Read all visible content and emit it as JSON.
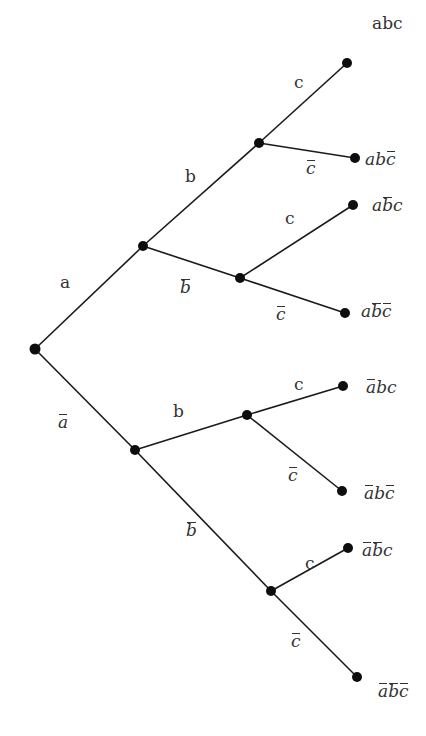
{
  "diagram": {
    "type": "probability-tree",
    "colors": {
      "background": "#ffffff",
      "line": "#1a1a1a",
      "node": "#0d0d0d",
      "text": "#333333"
    },
    "nodes": [
      {
        "id": "root",
        "x": 35,
        "y": 349
      },
      {
        "id": "a",
        "x": 143,
        "y": 246
      },
      {
        "id": "not_a",
        "x": 135,
        "y": 450
      },
      {
        "id": "ab",
        "x": 259,
        "y": 143
      },
      {
        "id": "a_not_b",
        "x": 240,
        "y": 278
      },
      {
        "id": "not_a_b",
        "x": 247,
        "y": 415
      },
      {
        "id": "not_a_not_b",
        "x": 271,
        "y": 591
      },
      {
        "id": "abc",
        "x": 347,
        "y": 63
      },
      {
        "id": "ab_not_c",
        "x": 355,
        "y": 158
      },
      {
        "id": "a_not_b_c",
        "x": 353,
        "y": 205
      },
      {
        "id": "a_not_b_not_c",
        "x": 345,
        "y": 313
      },
      {
        "id": "not_a_bc",
        "x": 343,
        "y": 386
      },
      {
        "id": "not_a_b_not_c",
        "x": 342,
        "y": 491
      },
      {
        "id": "not_a_not_b_c",
        "x": 348,
        "y": 548
      },
      {
        "id": "not_a_not_b_not_c",
        "x": 357,
        "y": 677
      }
    ],
    "edges": [
      {
        "from": "root",
        "to": "a",
        "label": "a",
        "barred": false,
        "lx": 60,
        "ly": 274
      },
      {
        "from": "root",
        "to": "not_a",
        "label": "a",
        "barred": true,
        "lx": 58,
        "ly": 414
      },
      {
        "from": "a",
        "to": "ab",
        "label": "b",
        "barred": false,
        "lx": 185,
        "ly": 168
      },
      {
        "from": "a",
        "to": "a_not_b",
        "label": "b",
        "barred": true,
        "lx": 180,
        "ly": 279
      },
      {
        "from": "not_a",
        "to": "not_a_b",
        "label": "b",
        "barred": false,
        "lx": 173,
        "ly": 403
      },
      {
        "from": "not_a",
        "to": "not_a_not_b",
        "label": "b",
        "barred": true,
        "lx": 186,
        "ly": 522
      },
      {
        "from": "ab",
        "to": "abc",
        "label": "c",
        "barred": false,
        "lx": 294,
        "ly": 74
      },
      {
        "from": "ab",
        "to": "ab_not_c",
        "label": "c",
        "barred": true,
        "lx": 306,
        "ly": 160
      },
      {
        "from": "a_not_b",
        "to": "a_not_b_c",
        "label": "c",
        "barred": false,
        "lx": 285,
        "ly": 210
      },
      {
        "from": "a_not_b",
        "to": "a_not_b_not_c",
        "label": "c",
        "barred": true,
        "lx": 276,
        "ly": 306
      },
      {
        "from": "not_a_b",
        "to": "not_a_bc",
        "label": "c",
        "barred": false,
        "lx": 294,
        "ly": 376
      },
      {
        "from": "not_a_b",
        "to": "not_a_b_not_c",
        "label": "c",
        "barred": true,
        "lx": 288,
        "ly": 467
      },
      {
        "from": "not_a_not_b",
        "to": "not_a_not_b_c",
        "label": "c",
        "barred": false,
        "lx": 305,
        "ly": 555
      },
      {
        "from": "not_a_not_b",
        "to": "not_a_not_b_not_c",
        "label": "c",
        "barred": true,
        "lx": 291,
        "ly": 633
      }
    ],
    "leaf_labels": [
      {
        "node": "abc",
        "text": "abc",
        "italic": false,
        "bars": [
          false,
          false,
          false
        ],
        "lx": 372,
        "ly": 15
      },
      {
        "node": "ab_not_c",
        "text": "abc",
        "italic": true,
        "bars": [
          false,
          false,
          true
        ],
        "lx": 365,
        "ly": 151
      },
      {
        "node": "a_not_b_c",
        "text": "abc",
        "italic": true,
        "bars": [
          false,
          true,
          false
        ],
        "lx": 372,
        "ly": 197
      },
      {
        "node": "a_not_b_not_c",
        "text": "abc",
        "italic": true,
        "bars": [
          false,
          true,
          true
        ],
        "lx": 361,
        "ly": 303
      },
      {
        "node": "not_a_bc",
        "text": "abc",
        "italic": true,
        "bars": [
          true,
          false,
          false
        ],
        "lx": 366,
        "ly": 379
      },
      {
        "node": "not_a_b_not_c",
        "text": "abc",
        "italic": true,
        "bars": [
          true,
          false,
          true
        ],
        "lx": 364,
        "ly": 485
      },
      {
        "node": "not_a_not_b_c",
        "text": "abc",
        "italic": true,
        "bars": [
          true,
          true,
          false
        ],
        "lx": 362,
        "ly": 542
      },
      {
        "node": "not_a_not_b_not_c",
        "text": "abc",
        "italic": true,
        "bars": [
          true,
          true,
          true
        ],
        "lx": 378,
        "ly": 683
      }
    ]
  }
}
